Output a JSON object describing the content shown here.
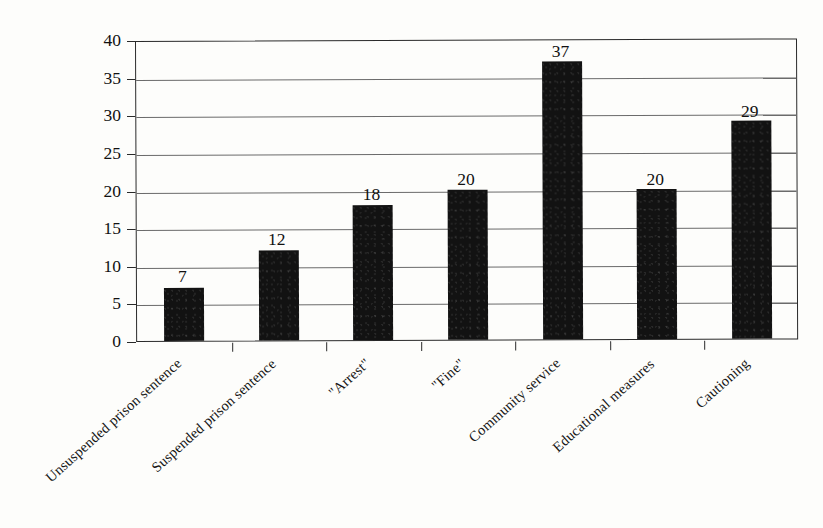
{
  "chart_data": {
    "type": "bar",
    "title": "",
    "subtitle": "",
    "xlabel": "",
    "ylabel": "",
    "categories": [
      "Unsuspended prison sentence",
      "Suspended prison sentence",
      "\"Arrest\"",
      "\"Fine\"",
      "Community service",
      "Educational measures",
      "Cautioning"
    ],
    "values": [
      7,
      12,
      18,
      20,
      37,
      20,
      29
    ],
    "data_labels": [
      "7",
      "12",
      "18",
      "20",
      "37",
      "20",
      "29"
    ],
    "ylim": [
      0,
      40
    ],
    "ytick_values": [
      0,
      5,
      10,
      15,
      20,
      25,
      30,
      35,
      40
    ],
    "ytick_labels": [
      "0",
      "5",
      "10",
      "15",
      "20",
      "25",
      "30",
      "35",
      "40"
    ],
    "grid": "horizontal",
    "legend": "none",
    "bar_color": "#121212",
    "frame_color": "#2a2a2a",
    "gridline_color": "#6b6b6b",
    "background_color": "#fdfdfb"
  }
}
